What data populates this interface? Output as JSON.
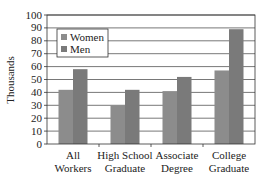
{
  "chart_data": {
    "type": "bar",
    "title": "",
    "xlabel": "",
    "ylabel": "Thousands",
    "ylim": [
      0,
      100
    ],
    "yticks": [
      0,
      10,
      20,
      30,
      40,
      50,
      60,
      70,
      80,
      90,
      100
    ],
    "grid": true,
    "legend_position": "upper-left",
    "categories": [
      [
        "All",
        "Workers"
      ],
      [
        "High School",
        "Graduate"
      ],
      [
        "Associate",
        "Degree"
      ],
      [
        "College",
        "Graduate"
      ]
    ],
    "series": [
      {
        "name": "Women",
        "color": "#8c8c8c",
        "values": [
          42,
          30,
          41,
          57
        ]
      },
      {
        "name": "Men",
        "color": "#7a7a7a",
        "values": [
          58,
          42,
          52,
          89
        ]
      }
    ]
  }
}
